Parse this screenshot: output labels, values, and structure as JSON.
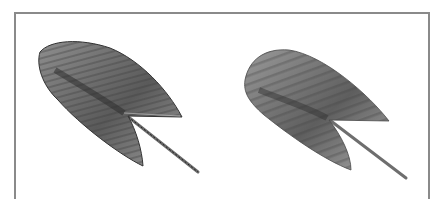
{
  "figure": {
    "panels": [
      {
        "id": "left",
        "label": "",
        "subject": "leaf",
        "style": "pixelated grayscale"
      },
      {
        "id": "right",
        "label": "",
        "subject": "leaf",
        "style": "smooth grayscale"
      }
    ],
    "colors": {
      "frame": "#8a8a8a",
      "leaf_dark": "#4a4a4a",
      "leaf_mid": "#8c8c8c",
      "leaf_light": "#b8b8b8",
      "stem": "#7a7a7a",
      "background": "#ffffff"
    }
  }
}
